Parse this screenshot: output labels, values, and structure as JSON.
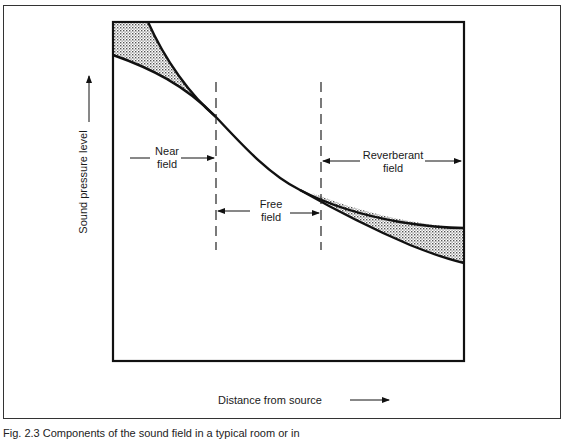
{
  "figure": {
    "caption": "Fig. 2.3 Components of the sound field in a typical room or in"
  },
  "axes": {
    "ylabel": "Sound pressure level",
    "xlabel": "Distance from source"
  },
  "regions": {
    "near_field": {
      "line1": "Near",
      "line2": "field"
    },
    "free_field": {
      "line1": "Free",
      "line2": "field"
    },
    "reverberant_field": {
      "line1": "Reverberant",
      "line2": "field"
    }
  },
  "colors": {
    "line": "#111111",
    "frame": "#333333",
    "shading": "#9a9a9a",
    "background": "#ffffff"
  }
}
